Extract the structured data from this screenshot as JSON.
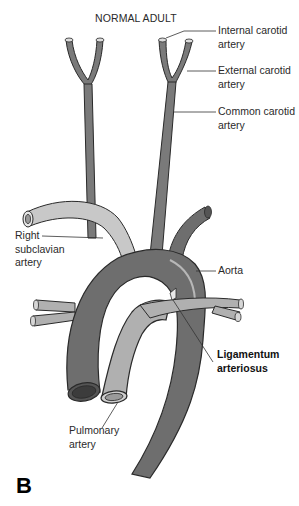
{
  "figure": {
    "title": "NORMAL ADULT",
    "panel_letter": "B",
    "colors": {
      "aorta": "#6e6e6e",
      "aorta_dark": "#4a4a4a",
      "pulmonary": "#b0b0b0",
      "subclavian": "#c8c8c8",
      "carotid": "#7a7a7a",
      "outline": "#2a2a2a",
      "leader_line": "#333333"
    },
    "labels": {
      "internal_carotid": {
        "line1": "Internal carotid",
        "line2": "artery"
      },
      "external_carotid": {
        "line1": "External carotid",
        "line2": "artery"
      },
      "common_carotid": {
        "line1": "Common carotid",
        "line2": "artery"
      },
      "right_subclavian": {
        "line1": "Right",
        "line2": "subclavian",
        "line3": "artery"
      },
      "aorta": {
        "line1": "Aorta"
      },
      "ligamentum": {
        "line1": "Ligamentum",
        "line2": "arteriosus"
      },
      "pulmonary": {
        "line1": "Pulmonary",
        "line2": "artery"
      }
    }
  }
}
